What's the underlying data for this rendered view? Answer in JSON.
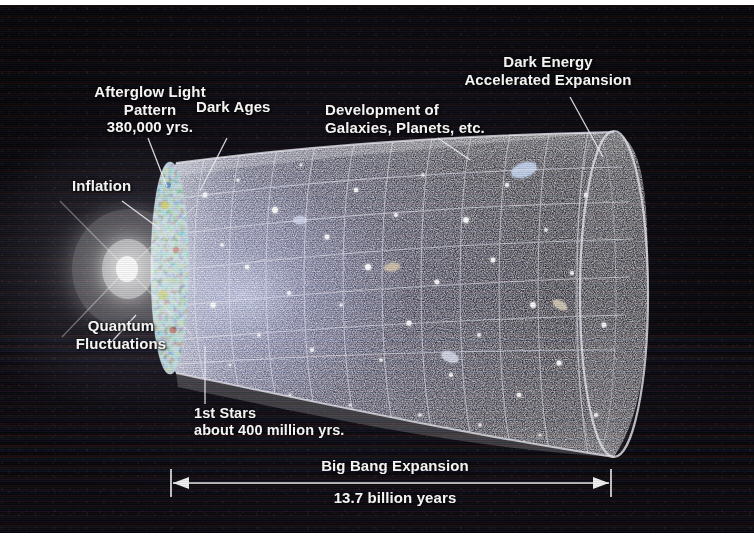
{
  "labels": {
    "afterglow": "Afterglow Light\nPattern\n380,000 yrs.",
    "dark_ages": "Dark Ages",
    "development": "Development of\nGalaxies, Planets, etc.",
    "dark_energy": "Dark Energy\nAccelerated Expansion",
    "inflation": "Inflation",
    "quantum": "Quantum\nFluctuations",
    "first_stars": "1st Stars\nabout 400 million yrs.",
    "big_bang": "Big Bang Expansion",
    "duration": "13.7 billion years"
  },
  "scale_bar": {
    "caption": "Big Bang Expansion",
    "value": "13.7 billion years",
    "arrow_style": "double-headed"
  },
  "colors": {
    "background": "#070609",
    "label_text": "#ffffff",
    "grid": "#e8e8f2",
    "cmb_disk_green": "#5fae4a",
    "cmb_disk_blue": "#2f6fc0",
    "cmb_disk_yellow": "#d8cc3e",
    "cmb_disk_red": "#c03a2a",
    "page_border": "#ffffff"
  },
  "icons": {
    "left_arrow": "left-arrowhead-icon",
    "right_arrow": "right-arrowhead-icon"
  }
}
